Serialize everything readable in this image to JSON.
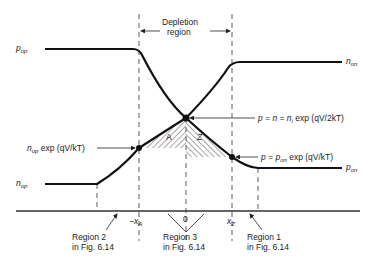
{
  "diagram": {
    "title_bracket": {
      "line1": "Depletion",
      "line2": "region"
    },
    "labels": {
      "p_op": {
        "main": "p",
        "sub": "op"
      },
      "n_on": {
        "main": "n",
        "sub": "on"
      },
      "n_op": {
        "main": "n",
        "sub": "op"
      },
      "p_on": {
        "main": "p",
        "sub": "on"
      },
      "junction_eq": "p = n = n",
      "junction_eq_sub": "i",
      "junction_eq_tail": " exp (qV/2kT)",
      "p_edge_eq_head": "p = p",
      "p_edge_eq_sub": "on",
      "p_edge_eq_tail": " exp (qV/kT)",
      "n_edge_eq_head": "n",
      "n_edge_eq_sub": "op",
      "n_edge_eq_tail": " exp (qV/kT)",
      "region_A": "A",
      "region_Z": "Z"
    },
    "axis_ticks": {
      "minus_xA": "−x",
      "minus_xA_sub": "A",
      "zero": "0",
      "xZ": "x",
      "xZ_sub": "Z"
    },
    "regions": [
      {
        "line1": "Region 2",
        "line2": "in Fig. 6.14"
      },
      {
        "line1": "Region 3",
        "line2": "in Fig. 6.14"
      },
      {
        "line1": "Region 1",
        "line2": "in Fig. 6.14"
      }
    ],
    "colors": {
      "ink": "#111111",
      "text": "#222222",
      "background": "#ffffff"
    }
  }
}
